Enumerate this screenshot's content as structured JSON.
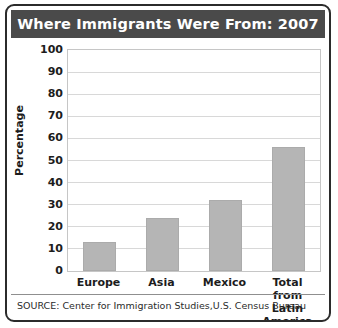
{
  "figure": {
    "title": "Where Immigrants Were From: 2007",
    "source_note": "SOURCE: Center for Immigration Studies,U.S. Census Bureau",
    "title_bar_color": "#4a4a4a",
    "title_text_color": "#ffffff",
    "bar_color": "#b5b5b5",
    "frame_color": "#2b2b2b",
    "gridline_color": "#d8d8d8"
  },
  "chart_data": {
    "type": "bar",
    "title": "Where Immigrants Were From: 2007",
    "xlabel": "",
    "ylabel": "Percentage",
    "categories": [
      "Europe",
      "Asia",
      "Mexico",
      "Total from Latin America"
    ],
    "category_lines": [
      [
        "Europe"
      ],
      [
        "Asia"
      ],
      [
        "Mexico"
      ],
      [
        "Total from",
        "Latin",
        "America"
      ]
    ],
    "values": [
      13,
      24,
      32,
      56
    ],
    "ylim": [
      0,
      100
    ],
    "yticks": [
      100,
      90,
      80,
      70,
      60,
      50,
      40,
      30,
      20,
      10,
      0
    ],
    "grid": true,
    "legend": null,
    "series": [
      {
        "name": "Percentage of immigrants",
        "values": [
          13,
          24,
          32,
          56
        ]
      }
    ]
  }
}
